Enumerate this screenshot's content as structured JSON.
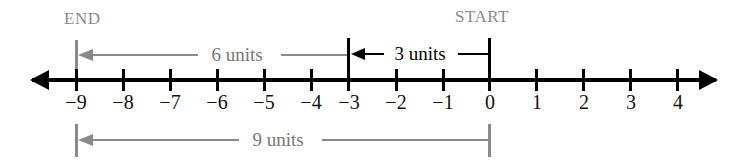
{
  "diagram": {
    "type": "number-line",
    "background_color": "#ffffff",
    "axis": {
      "min_tick": -9,
      "max_tick": 4,
      "ticks": [
        -9,
        -8,
        -7,
        -6,
        -5,
        -4,
        -3,
        -2,
        -1,
        0,
        1,
        2,
        3,
        4
      ],
      "tick_labels": [
        "−9",
        "−8",
        "−7",
        "−6",
        "−5",
        "−4",
        "−3",
        "−2",
        "−1",
        "0",
        "1",
        "2",
        "3",
        "4"
      ],
      "color": "#000000",
      "arrow_left": true,
      "arrow_right": true
    },
    "endpoints": {
      "end_label": "END",
      "end_value": -9,
      "start_label": "START",
      "start_value": 0,
      "label_color": "#8a8a8a"
    },
    "measurements": [
      {
        "id": "six-units",
        "label": "6 units",
        "from": -9,
        "to": -3,
        "magnitude": 6,
        "direction": "left",
        "color": "#8a8a8a",
        "position": "above"
      },
      {
        "id": "three-units",
        "label": "3 units",
        "from": 0,
        "to": -3,
        "magnitude": 3,
        "direction": "left",
        "color": "#000000",
        "position": "above"
      },
      {
        "id": "nine-units",
        "label": "9 units",
        "from": 0,
        "to": -9,
        "magnitude": 9,
        "direction": "left",
        "color": "#8a8a8a",
        "position": "below"
      }
    ]
  }
}
